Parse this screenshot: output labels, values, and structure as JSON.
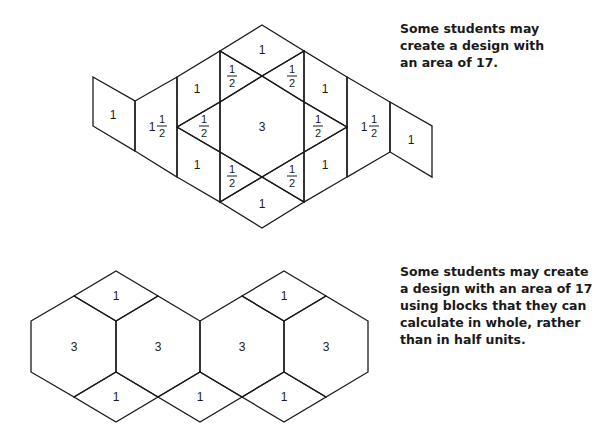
{
  "figure_top": {
    "caption_lines": [
      "Some students may",
      "create a design with",
      "an area of 17."
    ],
    "labels": {
      "left_square": "1",
      "left_one_half": "1",
      "right_one_half": "1",
      "right_square": "1",
      "upper_left": "1",
      "lower_left": "1",
      "upper_right": "1",
      "lower_right": "1",
      "top": "1",
      "bottom": "1",
      "center_hex": "3",
      "half_num": "1",
      "half_den": "2"
    }
  },
  "figure_bottom": {
    "caption_lines": [
      "Some students may create",
      "a design with an area of 17",
      "using blocks that they can",
      "calculate in whole, rather",
      "than in half units."
    ],
    "hex_labels": [
      "3",
      "3",
      "3",
      "3"
    ],
    "top_rhombus_labels": [
      "1",
      "1"
    ],
    "bottom_rhombus_labels": [
      "1",
      "1",
      "1"
    ]
  }
}
